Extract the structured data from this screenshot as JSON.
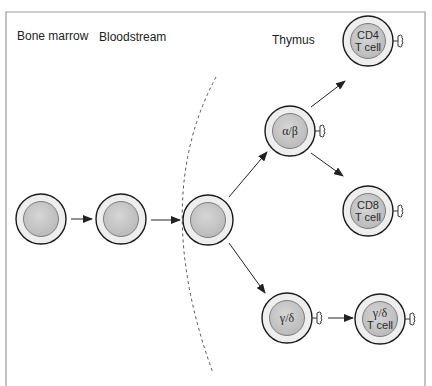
{
  "regions": {
    "bone_marrow": "Bone marrow",
    "bloodstream": "Bloodstream",
    "thymus": "Thymus"
  },
  "cells": {
    "alpha_beta": "α/β",
    "cd4": {
      "line1": "CD4",
      "line2": "T cell"
    },
    "cd8": {
      "line1": "CD8",
      "line2": "T cell"
    },
    "gamma_delta": "γ/δ",
    "gamma_delta_t": {
      "line1": "γ/δ",
      "line2": "T cell"
    }
  },
  "colors": {
    "frame": "#9a9a9a",
    "cell_outline": "#1a1a1a",
    "cell_ring": "#eeeeee",
    "nucleus": "#c4c4c4",
    "arrow": "#222222",
    "boundary_dash": "#555555"
  }
}
